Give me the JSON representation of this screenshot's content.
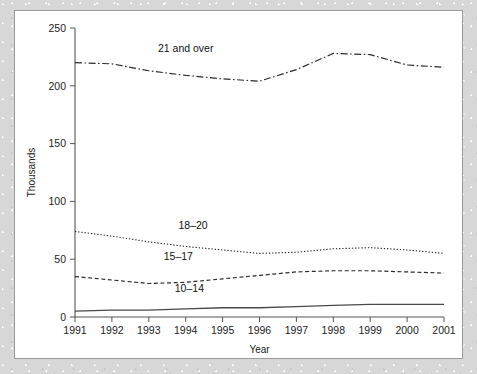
{
  "chart_data": {
    "type": "line",
    "title": "",
    "xlabel": "Year",
    "ylabel": "Thousands",
    "xlim": [
      1991,
      2001
    ],
    "ylim": [
      0,
      250
    ],
    "ytick_values": [
      0,
      50,
      100,
      150,
      200,
      250
    ],
    "ytick_labels": [
      "0",
      "50",
      "100",
      "150",
      "200",
      "250"
    ],
    "x": [
      1991,
      1992,
      1993,
      1994,
      1995,
      1996,
      1997,
      1998,
      1999,
      2000,
      2001
    ],
    "xtick_labels": [
      "1991",
      "1992",
      "1993",
      "1994",
      "1995",
      "1996",
      "1997",
      "1998",
      "1999",
      "2000",
      "2001"
    ],
    "grid": false,
    "legend": "inline-labels",
    "series": [
      {
        "name": "21 and over",
        "style": "dash-dot",
        "label_position": {
          "x": 1994.0,
          "y": 232
        },
        "values": [
          220,
          219,
          213,
          209,
          206,
          204,
          214,
          228,
          227,
          218,
          216
        ]
      },
      {
        "name": "18-20",
        "style": "dotted",
        "label_position": {
          "x": 1994.2,
          "y": 79
        },
        "values": [
          74,
          70,
          65,
          61,
          58,
          55,
          56,
          59,
          60,
          58,
          55
        ]
      },
      {
        "name": "15-17",
        "style": "dashed",
        "label_position": {
          "x": 1993.8,
          "y": 52
        },
        "values": [
          35,
          32,
          29,
          30,
          33,
          36,
          39,
          40,
          40,
          39,
          38
        ]
      },
      {
        "name": "10-14",
        "style": "solid",
        "label_position": {
          "x": 1994.1,
          "y": 25
        },
        "values": [
          5,
          6,
          6,
          7,
          8,
          8,
          9,
          10,
          11,
          11,
          11
        ]
      }
    ]
  }
}
